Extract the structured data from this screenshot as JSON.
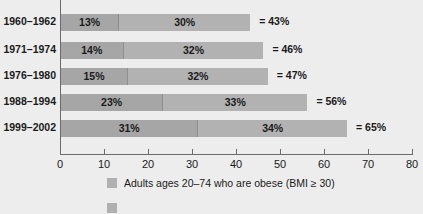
{
  "chart_data": {
    "type": "bar",
    "orientation": "horizontal",
    "stacked": true,
    "title": "",
    "xlabel": "",
    "ylabel": "",
    "xlim": [
      0,
      80
    ],
    "xticks": [
      0,
      10,
      20,
      30,
      40,
      50,
      60,
      70,
      80
    ],
    "xtick_labels": [
      "0",
      "10",
      "20",
      "30",
      "40",
      "50",
      "60",
      "70",
      "80"
    ],
    "grid": false,
    "legend_position": "bottom",
    "categories": [
      "1960–1962",
      "1971–1974",
      "1976–1980",
      "1988–1994",
      "1999–2002"
    ],
    "series": [
      {
        "name": "Adults ages 20–74 who are obese (BMI ≥ 30)",
        "values": [
          13,
          14,
          15,
          23,
          31
        ]
      },
      {
        "name": "",
        "values": [
          30,
          32,
          32,
          33,
          34
        ]
      }
    ],
    "totals": [
      43,
      46,
      47,
      56,
      65
    ],
    "rows": [
      {
        "label": "1960–1962",
        "seg1": 13,
        "seg2": 30,
        "seg1_label": "13%",
        "seg2_label": "30%",
        "total_label": "= 43%"
      },
      {
        "label": "1971–1974",
        "seg1": 14,
        "seg2": 32,
        "seg1_label": "14%",
        "seg2_label": "32%",
        "total_label": "= 46%"
      },
      {
        "label": "1976–1980",
        "seg1": 15,
        "seg2": 32,
        "seg1_label": "15%",
        "seg2_label": "32%",
        "total_label": "= 47%"
      },
      {
        "label": "1988–1994",
        "seg1": 23,
        "seg2": 33,
        "seg1_label": "23%",
        "seg2_label": "33%",
        "total_label": "= 56%"
      },
      {
        "label": "1999–2002",
        "seg1": 31,
        "seg2": 34,
        "seg1_label": "31%",
        "seg2_label": "34%",
        "total_label": "= 65%"
      }
    ],
    "legend": [
      {
        "label": "Adults ages 20–74 who are obese (BMI ≥ 30)",
        "color": "#b0b0b0"
      },
      {
        "label": "",
        "color": "#b0b0b0"
      }
    ],
    "colors": {
      "background": "#ededed",
      "segment1": "#a6a6a6",
      "segment2": "#b2b2b2",
      "axis": "#6b6b6b",
      "text": "#1a1a1a"
    }
  }
}
